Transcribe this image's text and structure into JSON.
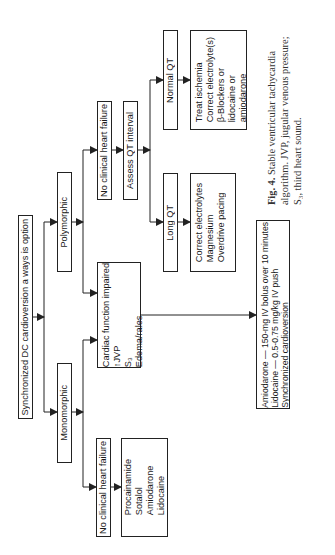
{
  "figure": {
    "root": "Synchronized DC cardioversion a ways is option",
    "branches": {
      "polymorphic": {
        "label": "Polymorphic",
        "no_chf": "No clinical heart failure",
        "assess_qt": "Assess QT interval",
        "long_qt": {
          "label": "Long QT",
          "treatment": [
            "Correct electrolytes",
            "Magnesium",
            "Overdrive pacing"
          ]
        },
        "normal_qt": {
          "label": "Normal QT",
          "treatment": [
            "Treat ischemia",
            "Correct electrolyte(s)",
            "β-Blockers or",
            "lidocaine or",
            "amiodarone"
          ]
        }
      },
      "monomorphic": {
        "label": "Monomorphic",
        "no_chf": "No clinical heart failure",
        "drugs": [
          "Procainamide",
          "Sotalol",
          "Amiodarone",
          "Lidocaine"
        ]
      },
      "cardiac_impaired": {
        "lines": [
          "Cardiac function impaired",
          "↑JVP",
          "S₃",
          "Edema/rales"
        ],
        "treatment": [
          "Amiodarone — 150-mg IV bolus over 10 minutes",
          "Lidocaine — 0.5-0.75 mg/kg IV push",
          "Synchronized cardioversion"
        ]
      }
    },
    "caption": {
      "label": "Fig. 4.",
      "text": "Stable ventricular tachycardia algorithm. JVP, jugular venous pressure; S₃, third heart sound."
    }
  }
}
